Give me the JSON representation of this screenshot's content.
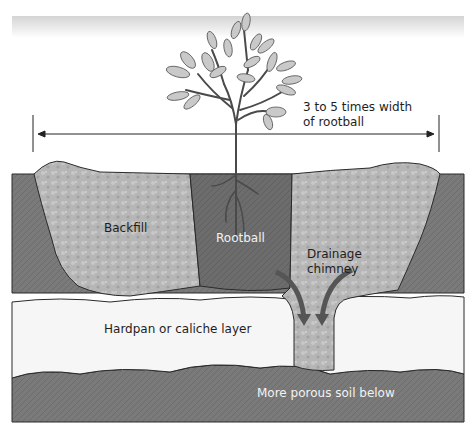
{
  "diagram": {
    "labels": {
      "width_note_line1": "3 to 5 times width",
      "width_note_line2": "of rootball",
      "backfill": "Backfill",
      "rootball": "Rootball",
      "drainage_line1": "Drainage",
      "drainage_line2": "chimney",
      "hardpan": "Hardpan or caliche layer",
      "porous_soil": "More porous soil below"
    },
    "colors": {
      "native_soil": "#7a7a7a",
      "backfill": "#b4b4b4",
      "rootball": "#6e6e6e",
      "hardpan": "#f6f6f6",
      "porous_soil": "#7c7c7c",
      "arrow": "#555555",
      "outline": "#2a2a2a",
      "leaf": "#c9c9c9",
      "header_band": "#d8d8d8"
    }
  }
}
